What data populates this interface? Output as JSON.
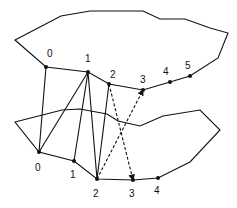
{
  "diagram": {
    "stroke_color": "#111111",
    "top_contour": {
      "outline": [
        [
          15,
          40
        ],
        [
          61,
          16
        ],
        [
          90,
          11
        ],
        [
          143,
          11
        ],
        [
          160,
          19
        ],
        [
          185,
          19
        ],
        [
          210,
          28
        ],
        [
          228,
          33
        ],
        [
          218,
          58
        ],
        [
          190,
          76
        ],
        [
          170,
          82
        ],
        [
          143,
          90
        ],
        [
          109,
          84
        ],
        [
          88,
          72
        ],
        [
          46,
          67
        ]
      ],
      "points": [
        {
          "label": "0",
          "x": 46,
          "y": 67,
          "lx": 47,
          "ly": 57
        },
        {
          "label": "1",
          "x": 88,
          "y": 72,
          "lx": 85,
          "ly": 62
        },
        {
          "label": "2",
          "x": 109,
          "y": 84,
          "lx": 110,
          "ly": 78
        },
        {
          "label": "3",
          "x": 143,
          "y": 90,
          "lx": 140,
          "ly": 83
        },
        {
          "label": "4",
          "x": 170,
          "y": 82,
          "lx": 163,
          "ly": 75
        },
        {
          "label": "5",
          "x": 190,
          "y": 76,
          "lx": 185,
          "ly": 69
        }
      ]
    },
    "bottom_contour": {
      "outline": [
        [
          15,
          122
        ],
        [
          62,
          110
        ],
        [
          80,
          109
        ],
        [
          107,
          114
        ],
        [
          118,
          121
        ],
        [
          140,
          126
        ],
        [
          163,
          116
        ],
        [
          200,
          110
        ],
        [
          220,
          130
        ],
        [
          190,
          162
        ],
        [
          158,
          178
        ],
        [
          133,
          180
        ],
        [
          97,
          179
        ],
        [
          74,
          161
        ],
        [
          39,
          152
        ]
      ],
      "points": [
        {
          "label": "0",
          "x": 39,
          "y": 152,
          "lx": 35,
          "ly": 171
        },
        {
          "label": "1",
          "x": 74,
          "y": 161,
          "lx": 70,
          "ly": 178
        },
        {
          "label": "2",
          "x": 97,
          "y": 179,
          "lx": 93,
          "ly": 197
        },
        {
          "label": "3",
          "x": 133,
          "y": 180,
          "lx": 129,
          "ly": 197
        },
        {
          "label": "4",
          "x": 158,
          "y": 178,
          "lx": 154,
          "ly": 194
        }
      ]
    },
    "connections": [
      {
        "from": "top.0",
        "to": "bottom.0",
        "style": "solid"
      },
      {
        "from": "top.1",
        "to": "bottom.0",
        "style": "solid"
      },
      {
        "from": "top.1",
        "to": "bottom.1",
        "style": "solid"
      },
      {
        "from": "top.1",
        "to": "bottom.2",
        "style": "solid"
      },
      {
        "from": "top.2",
        "to": "bottom.2",
        "style": "solid"
      },
      {
        "from": "top.2",
        "to": "bottom.3",
        "style": "dashed-arrow"
      },
      {
        "from": "bottom.2",
        "to": "top.3",
        "style": "dashed-arrow"
      }
    ]
  }
}
